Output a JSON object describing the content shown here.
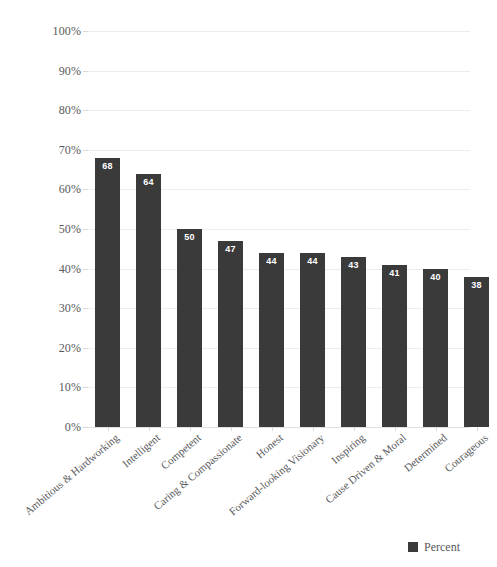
{
  "chart_data": {
    "type": "bar",
    "title": "",
    "subtitle": "",
    "xlabel": "",
    "ylabel": "",
    "ylim": [
      0,
      100
    ],
    "ytick_labels": [
      "100%",
      "90%",
      "80%",
      "70%",
      "60%",
      "50%",
      "40%",
      "30%",
      "20%",
      "10%",
      "0%"
    ],
    "ytick_values": [
      100,
      90,
      80,
      70,
      60,
      50,
      40,
      30,
      20,
      10,
      0
    ],
    "grid": true,
    "legend_position": "bottom-right",
    "categories": [
      "Ambitious & Hardworking",
      "Intelligent",
      "Competent",
      "Caring & Compassionate",
      "Honest",
      "Forward-looking Visionary",
      "Inspiring",
      "Cause Driven & Moral",
      "Determined",
      "Courageous"
    ],
    "series": [
      {
        "name": "Percent",
        "color": "#3a3a3a",
        "values": [
          68,
          64,
          50,
          47,
          44,
          44,
          43,
          41,
          40,
          38
        ]
      }
    ],
    "data_labels": [
      "68",
      "64",
      "50",
      "47",
      "44",
      "44",
      "43",
      "41",
      "40",
      "38"
    ]
  },
  "legend": {
    "entries": [
      {
        "label": "Percent",
        "color": "#3a3a3a",
        "swatch": "square-swatch-icon"
      }
    ]
  },
  "colors": {
    "bar": "#3a3a3a",
    "gridline": "#ededed",
    "axis_text": "#58595b",
    "background": "#ffffff",
    "value_label": "#ffffff"
  }
}
